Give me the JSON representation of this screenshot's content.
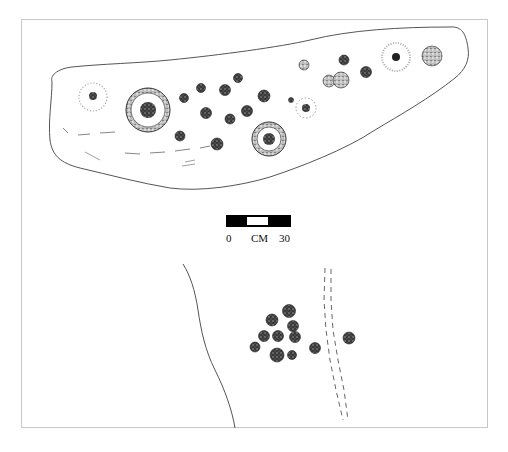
{
  "figure": {
    "type": "archaeological rock-art petroglyph drawing",
    "upper_panel": "boulder with cupules and ringed cupules",
    "lower_panel": "rock surface with cluster of cupules"
  },
  "scale_bar": {
    "left_label": "0",
    "unit_label": "CM",
    "right_label": "30"
  }
}
